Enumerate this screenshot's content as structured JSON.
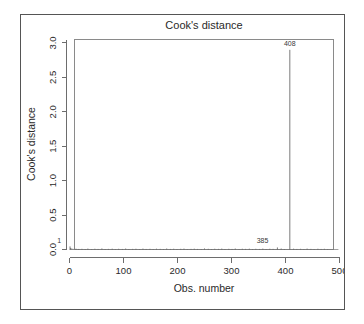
{
  "chart_data": {
    "type": "bar",
    "title": "Cook's distance",
    "xlabel": "Obs. number",
    "ylabel": "Cook's distance",
    "xlim": [
      0,
      500
    ],
    "ylim": [
      0.0,
      3.05
    ],
    "xticks": [
      0,
      100,
      200,
      300,
      400,
      500
    ],
    "xtick_labels": [
      "0",
      "100",
      "200",
      "300",
      "400",
      "500"
    ],
    "yticks": [
      0.0,
      0.5,
      1.0,
      1.5,
      2.0,
      2.5,
      3.0
    ],
    "ytick_labels": [
      "0.0",
      "0.5",
      "1.0",
      "1.5",
      "2.0",
      "2.5",
      "3.0"
    ],
    "grid": false,
    "legend": null,
    "annotations": [
      {
        "label": "408",
        "x": 408,
        "y": 2.93,
        "position": "above-spike"
      },
      {
        "label": "385",
        "x": 385,
        "y": 0.06,
        "position": "above-baseline"
      },
      {
        "label": "1",
        "x": 1,
        "y": 0.07,
        "position": "above-baseline"
      }
    ],
    "series": [
      {
        "name": "Cook's distance",
        "type": "stems",
        "points": [
          {
            "x": 408,
            "y": 2.9
          },
          {
            "x": 1,
            "y": 0.045
          },
          {
            "x": 385,
            "y": 0.03
          },
          {
            "x": 2,
            "y": 0.02
          },
          {
            "x": 3,
            "y": 0.014
          },
          {
            "x": 5,
            "y": 0.011
          },
          {
            "x": 8,
            "y": 0.009
          },
          {
            "x": 12,
            "y": 0.012
          },
          {
            "x": 17,
            "y": 0.008
          },
          {
            "x": 23,
            "y": 0.01
          },
          {
            "x": 29,
            "y": 0.007
          },
          {
            "x": 34,
            "y": 0.013
          },
          {
            "x": 41,
            "y": 0.006
          },
          {
            "x": 47,
            "y": 0.011
          },
          {
            "x": 53,
            "y": 0.008
          },
          {
            "x": 60,
            "y": 0.015
          },
          {
            "x": 66,
            "y": 0.007
          },
          {
            "x": 72,
            "y": 0.009
          },
          {
            "x": 79,
            "y": 0.012
          },
          {
            "x": 85,
            "y": 0.006
          },
          {
            "x": 91,
            "y": 0.01
          },
          {
            "x": 98,
            "y": 0.008
          },
          {
            "x": 104,
            "y": 0.014
          },
          {
            "x": 110,
            "y": 0.007
          },
          {
            "x": 117,
            "y": 0.009
          },
          {
            "x": 123,
            "y": 0.011
          },
          {
            "x": 130,
            "y": 0.006
          },
          {
            "x": 136,
            "y": 0.013
          },
          {
            "x": 142,
            "y": 0.008
          },
          {
            "x": 149,
            "y": 0.01
          },
          {
            "x": 155,
            "y": 0.007
          },
          {
            "x": 161,
            "y": 0.012
          },
          {
            "x": 168,
            "y": 0.009
          },
          {
            "x": 174,
            "y": 0.006
          },
          {
            "x": 180,
            "y": 0.014
          },
          {
            "x": 187,
            "y": 0.008
          },
          {
            "x": 193,
            "y": 0.011
          },
          {
            "x": 199,
            "y": 0.007
          },
          {
            "x": 206,
            "y": 0.01
          },
          {
            "x": 212,
            "y": 0.013
          },
          {
            "x": 218,
            "y": 0.006
          },
          {
            "x": 225,
            "y": 0.009
          },
          {
            "x": 231,
            "y": 0.012
          },
          {
            "x": 237,
            "y": 0.008
          },
          {
            "x": 244,
            "y": 0.007
          },
          {
            "x": 250,
            "y": 0.015
          },
          {
            "x": 257,
            "y": 0.01
          },
          {
            "x": 263,
            "y": 0.006
          },
          {
            "x": 269,
            "y": 0.011
          },
          {
            "x": 276,
            "y": 0.009
          },
          {
            "x": 282,
            "y": 0.013
          },
          {
            "x": 288,
            "y": 0.007
          },
          {
            "x": 295,
            "y": 0.01
          },
          {
            "x": 301,
            "y": 0.008
          },
          {
            "x": 307,
            "y": 0.014
          },
          {
            "x": 314,
            "y": 0.006
          },
          {
            "x": 320,
            "y": 0.011
          },
          {
            "x": 326,
            "y": 0.009
          },
          {
            "x": 333,
            "y": 0.012
          },
          {
            "x": 339,
            "y": 0.007
          },
          {
            "x": 345,
            "y": 0.01
          },
          {
            "x": 352,
            "y": 0.008
          },
          {
            "x": 358,
            "y": 0.013
          },
          {
            "x": 364,
            "y": 0.006
          },
          {
            "x": 371,
            "y": 0.011
          },
          {
            "x": 377,
            "y": 0.009
          },
          {
            "x": 392,
            "y": 0.014
          },
          {
            "x": 398,
            "y": 0.007
          },
          {
            "x": 415,
            "y": 0.012
          },
          {
            "x": 421,
            "y": 0.008
          },
          {
            "x": 428,
            "y": 0.01
          },
          {
            "x": 434,
            "y": 0.006
          },
          {
            "x": 440,
            "y": 0.013
          },
          {
            "x": 447,
            "y": 0.009
          },
          {
            "x": 453,
            "y": 0.007
          },
          {
            "x": 460,
            "y": 0.011
          },
          {
            "x": 466,
            "y": 0.008
          },
          {
            "x": 472,
            "y": 0.01
          },
          {
            "x": 478,
            "y": 0.006
          }
        ]
      }
    ]
  }
}
